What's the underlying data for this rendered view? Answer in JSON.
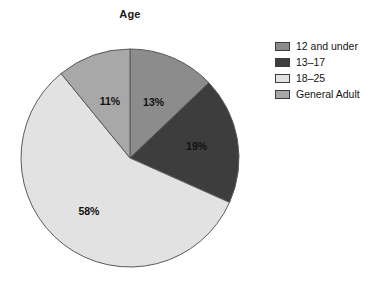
{
  "chart_data": {
    "type": "pie",
    "title": "Age",
    "categories": [
      "12 and under",
      "13–17",
      "18–25",
      "General Adult"
    ],
    "values": [
      13,
      19,
      58,
      11
    ],
    "data_labels": [
      "13%",
      "19%",
      "58%",
      "11%"
    ],
    "colors": [
      "#8c8c8c",
      "#3d3d3d",
      "#e2e2e2",
      "#a8a8a8"
    ],
    "start_angle_deg": 0,
    "direction": "clockwise",
    "units": "percent",
    "legend_position": "right",
    "grid": false,
    "xlabel": "",
    "ylabel": ""
  },
  "legend": {
    "items": [
      {
        "label": "12 and under",
        "color": "#8c8c8c"
      },
      {
        "label": "13–17",
        "color": "#3d3d3d"
      },
      {
        "label": "18–25",
        "color": "#e2e2e2"
      },
      {
        "label": "General Adult",
        "color": "#a8a8a8"
      }
    ]
  },
  "slice_labels": {
    "s0": "13%",
    "s1": "19%",
    "s2": "58%",
    "s3": "11%"
  },
  "geometry": {
    "center_x": 130,
    "center_y": 158,
    "radius": 109
  }
}
